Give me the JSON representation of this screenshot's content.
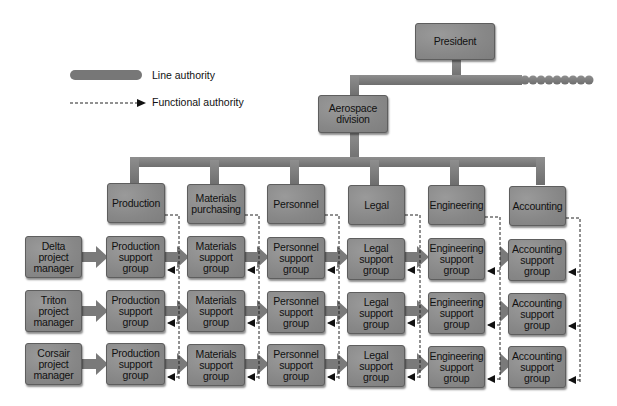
{
  "legend": {
    "line_authority": "Line authority",
    "functional_authority": "Functional authority"
  },
  "top": {
    "president": "President",
    "division": "Aerospace\ndivision"
  },
  "departments": [
    {
      "label": "Production"
    },
    {
      "label": "Materials\npurchasing"
    },
    {
      "label": "Personnel"
    },
    {
      "label": "Legal"
    },
    {
      "label": "Engineering"
    },
    {
      "label": "Accounting"
    }
  ],
  "project_managers": [
    {
      "label": "Delta\nproject\nmanager"
    },
    {
      "label": "Triton\nproject\nmanager"
    },
    {
      "label": "Corsair\nproject\nmanager"
    }
  ],
  "support_groups": [
    [
      "Production\nsupport\ngroup",
      "Materials\nsupport\ngroup",
      "Personnel\nsupport\ngroup",
      "Legal\nsupport\ngroup",
      "Engineering\nsupport\ngroup",
      "Accounting\nsupport\ngroup"
    ],
    [
      "Production\nsupport\ngroup",
      "Materials\nsupport\ngroup",
      "Personnel\nsupport\ngroup",
      "Legal\nsupport\ngroup",
      "Engineering\nsupport\ngroup",
      "Accounting\nsupport\ngroup"
    ],
    [
      "Production\nsupport\ngroup",
      "Materials\nsupport\ngroup",
      "Personnel\nsupport\ngroup",
      "Legal\nsupport\ngroup",
      "Engineering\nsupport\ngroup",
      "Accounting\nsupport\ngroup"
    ]
  ],
  "colors": {
    "box_fill": "#8c8c8c",
    "line_authority_bar": "#7a7a7a",
    "functional_line": "#333333",
    "background": "#ffffff"
  }
}
